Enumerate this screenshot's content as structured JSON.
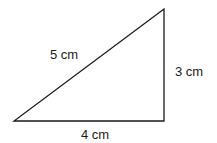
{
  "diagram": {
    "type": "right-triangle",
    "stroke_color": "#1a1a1a",
    "vertices": {
      "bottom_left": [
        14,
        121
      ],
      "bottom_right": [
        164,
        121
      ],
      "top_right": [
        164,
        9
      ]
    },
    "labels": {
      "hypotenuse": "5 cm",
      "vertical_side": "3 cm",
      "base": "4 cm"
    }
  }
}
